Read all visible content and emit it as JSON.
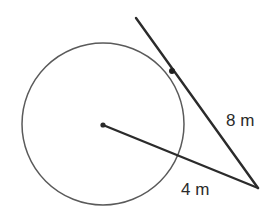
{
  "figure": {
    "background_color": "#ffffff",
    "width": 271,
    "height": 208
  },
  "geometry": {
    "circle": {
      "name": "circle",
      "center_x": 103,
      "center_y": 124,
      "radius": 81,
      "stroke_color": "#5a5a5a",
      "stroke_width": 1.5,
      "fill": "none"
    },
    "center_point": {
      "name": "circle-center-dot",
      "x": 103,
      "y": 125,
      "radius": 2.6,
      "color": "#2b2b2b"
    },
    "tangent_line": {
      "name": "tangent-line",
      "x1": 136,
      "y1": 18,
      "x2": 258,
      "y2": 188,
      "stroke_color": "#2b2b2b",
      "stroke_width": 2.4
    },
    "tangent_point": {
      "name": "tangent-point-marker",
      "x": 172,
      "y": 71,
      "radius": 3.0,
      "color": "#1f1f1f"
    },
    "secant_line": {
      "name": "secant-line",
      "x1": 103,
      "y1": 125,
      "x2": 258,
      "y2": 188,
      "stroke_color": "#2b2b2b",
      "stroke_width": 2.4
    },
    "external_point": {
      "name": "external-vertex",
      "x": 258,
      "y": 188
    }
  },
  "labels": {
    "tangent_length": {
      "text": "8 m",
      "x": 226,
      "y": 126,
      "font_size": 17
    },
    "secant_length": {
      "text": "4 m",
      "x": 181,
      "y": 195,
      "font_size": 17
    }
  },
  "colors": {
    "stroke_dark": "#2b2b2b",
    "stroke_light": "#5a5a5a",
    "text": "#2b2b2b",
    "background": "#ffffff"
  }
}
